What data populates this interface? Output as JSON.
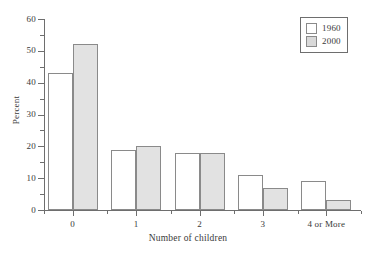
{
  "chart_data": {
    "type": "bar",
    "title": "",
    "xlabel": "Number of children",
    "ylabel": "Percent",
    "categories": [
      "0",
      "1",
      "2",
      "3",
      "4 or More"
    ],
    "series": [
      {
        "name": "1960",
        "values": [
          43,
          19,
          18,
          11,
          9
        ],
        "color": "#ffffff"
      },
      {
        "name": "2000",
        "values": [
          52,
          20,
          18,
          6.8,
          3
        ],
        "color": "#e2e2e2"
      }
    ],
    "ylim": [
      0,
      60
    ],
    "ytick_major": [
      0,
      10,
      20,
      30,
      40,
      50,
      60
    ],
    "ytick_minor": [
      5,
      15,
      25,
      35,
      45,
      55
    ],
    "ytick_labels": [
      "0",
      "10",
      "20",
      "30",
      "40",
      "50",
      "60"
    ],
    "grid": false,
    "legend_position": "top-right",
    "axis_color": "#6e6e6e",
    "bar_edge_color": "#8a8a8a",
    "text_color": "#3a3a3a",
    "background": "#ffffff"
  },
  "legend": {
    "entries": [
      {
        "label": "1960",
        "swatch": "white-swatch"
      },
      {
        "label": "2000",
        "swatch": "gray-swatch"
      }
    ]
  },
  "axes": {
    "x_title": "Number of children",
    "y_title": "Percent"
  }
}
